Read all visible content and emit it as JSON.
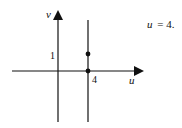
{
  "diagram": {
    "axes": {
      "horizontal_label": "u",
      "vertical_label": "v"
    },
    "ticks": {
      "v_tick": "1",
      "u_tick": "4"
    },
    "equation": {
      "lhs": "u",
      "rhs": "= 4."
    },
    "points": [
      {
        "u": 4,
        "v": 0
      },
      {
        "u": 4,
        "v": 1
      }
    ],
    "line": "vertical line u = 4",
    "colors": {
      "ink": "#111111",
      "background": "#ffffff"
    }
  }
}
